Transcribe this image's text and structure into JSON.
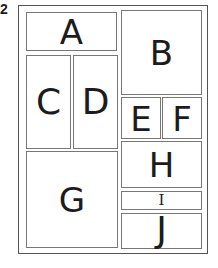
{
  "figure": {
    "number": "2",
    "regions": [
      {
        "id": "A",
        "label": "A"
      },
      {
        "id": "B",
        "label": "B"
      },
      {
        "id": "C",
        "label": "C"
      },
      {
        "id": "D",
        "label": "D"
      },
      {
        "id": "E",
        "label": "E"
      },
      {
        "id": "F",
        "label": "F"
      },
      {
        "id": "G",
        "label": "G"
      },
      {
        "id": "H",
        "label": "H"
      },
      {
        "id": "I",
        "label": "I"
      },
      {
        "id": "J",
        "label": "J"
      }
    ]
  },
  "colors": {
    "frame": "#555555",
    "box_border": "#777777",
    "text": "#1c1c1c",
    "background": "#ffffff"
  }
}
